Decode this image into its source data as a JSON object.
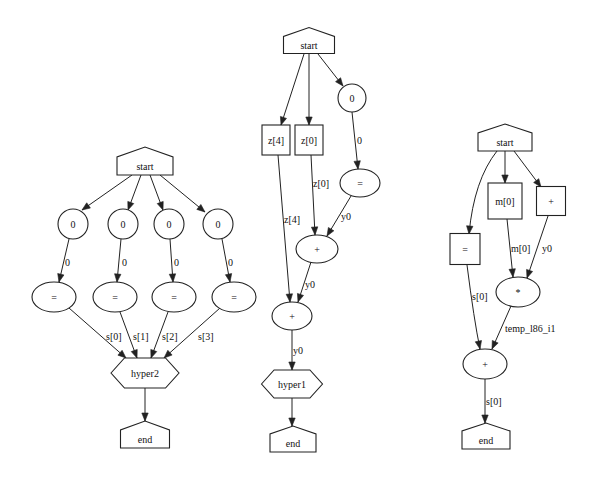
{
  "diagram": {
    "colors": {
      "stroke": "#222222",
      "background": "#ffffff",
      "text": "#111111"
    },
    "graphs": [
      {
        "id": "graph-hyper2",
        "nodes": [
          {
            "id": "g1_start",
            "label": "start",
            "shape": "house",
            "x": 145,
            "y": 166,
            "w": 56,
            "h": 18,
            "roof": 10
          },
          {
            "id": "g1_c0",
            "label": "0",
            "shape": "circle",
            "x": 73,
            "y": 224,
            "r": 15
          },
          {
            "id": "g1_c1",
            "label": "0",
            "shape": "circle",
            "x": 123,
            "y": 224,
            "r": 15
          },
          {
            "id": "g1_c2",
            "label": "0",
            "shape": "circle",
            "x": 169,
            "y": 224,
            "r": 15
          },
          {
            "id": "g1_c3",
            "label": "0",
            "shape": "circle",
            "x": 218,
            "y": 224,
            "r": 15
          },
          {
            "id": "g1_e0",
            "label": "=",
            "shape": "ellipse",
            "x": 54,
            "y": 297,
            "rx": 22,
            "ry": 15
          },
          {
            "id": "g1_e1",
            "label": "=",
            "shape": "ellipse",
            "x": 115,
            "y": 297,
            "rx": 22,
            "ry": 15
          },
          {
            "id": "g1_e2",
            "label": "=",
            "shape": "ellipse",
            "x": 174,
            "y": 297,
            "rx": 22,
            "ry": 15
          },
          {
            "id": "g1_e3",
            "label": "=",
            "shape": "ellipse",
            "x": 234,
            "y": 297,
            "rx": 22,
            "ry": 15
          },
          {
            "id": "g1_hyper",
            "label": "hyper2",
            "shape": "hexagon",
            "x": 145,
            "y": 373,
            "w": 68,
            "h": 30
          },
          {
            "id": "g1_end",
            "label": "end",
            "shape": "house",
            "x": 145,
            "y": 439,
            "w": 49,
            "h": 18,
            "roof": 9
          }
        ],
        "edges": [
          {
            "from": [
              132,
              175
            ],
            "to": [
              82,
              210
            ],
            "label": ""
          },
          {
            "from": [
              141,
              175
            ],
            "to": [
              128,
              210
            ],
            "label": ""
          },
          {
            "from": [
              150,
              175
            ],
            "to": [
              163,
              210
            ],
            "label": ""
          },
          {
            "from": [
              160,
              175
            ],
            "to": [
              205,
              212
            ],
            "label": ""
          },
          {
            "from": [
              69,
              239
            ],
            "to": [
              59,
              282
            ],
            "label": "0",
            "lx": 65,
            "ly": 262
          },
          {
            "from": [
              121,
              239
            ],
            "to": [
              117,
              282
            ],
            "label": "0",
            "lx": 122,
            "ly": 262
          },
          {
            "from": [
              170,
              239
            ],
            "to": [
              173,
              282
            ],
            "label": "0",
            "lx": 174,
            "ly": 262
          },
          {
            "from": [
              222,
              239
            ],
            "to": [
              230,
              282
            ],
            "label": "0",
            "lx": 228,
            "ly": 262
          },
          {
            "from": [
              69,
              308
            ],
            "to": [
              126,
              358
            ],
            "label": "s[0]",
            "lx": 106,
            "ly": 336
          },
          {
            "from": [
              120,
              312
            ],
            "to": [
              137,
              358
            ],
            "label": "s[1]",
            "lx": 133,
            "ly": 336
          },
          {
            "from": [
              168,
              312
            ],
            "to": [
              151,
              358
            ],
            "label": "s[2]",
            "lx": 162,
            "ly": 336
          },
          {
            "from": [
              220,
              308
            ],
            "to": [
              164,
              358
            ],
            "label": "s[3]",
            "lx": 198,
            "ly": 336
          },
          {
            "from": [
              145,
              388
            ],
            "to": [
              145,
              421
            ],
            "label": ""
          }
        ]
      },
      {
        "id": "graph-hyper1",
        "nodes": [
          {
            "id": "g2_start",
            "label": "start",
            "shape": "house",
            "x": 309,
            "y": 45,
            "w": 51,
            "h": 17,
            "roof": 9
          },
          {
            "id": "g2_z4",
            "label": "z[4]",
            "shape": "box",
            "x": 276,
            "y": 140,
            "w": 28,
            "h": 30
          },
          {
            "id": "g2_z0",
            "label": "z[0]",
            "shape": "box",
            "x": 309,
            "y": 140,
            "w": 28,
            "h": 30
          },
          {
            "id": "g2_c0",
            "label": "0",
            "shape": "circle",
            "x": 352,
            "y": 98,
            "r": 14
          },
          {
            "id": "g2_eq",
            "label": "=",
            "shape": "ellipse",
            "x": 360,
            "y": 183,
            "rx": 20,
            "ry": 14
          },
          {
            "id": "g2_plus1",
            "label": "+",
            "shape": "ellipse",
            "x": 317,
            "y": 249,
            "rx": 21,
            "ry": 14
          },
          {
            "id": "g2_plus2",
            "label": "+",
            "shape": "ellipse",
            "x": 292,
            "y": 316,
            "rx": 20,
            "ry": 14
          },
          {
            "id": "g2_hyper",
            "label": "hyper1",
            "shape": "hexagon",
            "x": 292,
            "y": 384,
            "w": 61,
            "h": 28
          },
          {
            "id": "g2_end",
            "label": "end",
            "shape": "house",
            "x": 293,
            "y": 443,
            "w": 46,
            "h": 18,
            "roof": 8
          }
        ],
        "edges": [
          {
            "from": [
              304,
              54
            ],
            "to": [
              281,
              125
            ],
            "label": ""
          },
          {
            "from": [
              309,
              54
            ],
            "to": [
              309,
              125
            ],
            "label": ""
          },
          {
            "from": [
              318,
              54
            ],
            "to": [
              343,
              86
            ],
            "label": ""
          },
          {
            "from": [
              352,
              112
            ],
            "to": [
              358,
              169
            ],
            "label": "0",
            "lx": 357,
            "ly": 140
          },
          {
            "from": [
              311,
              155
            ],
            "to": [
              315,
              235
            ],
            "label": "z[0]",
            "lx": 313,
            "ly": 183
          },
          {
            "from": [
              351,
              196
            ],
            "to": [
              327,
              236
            ],
            "label": "y0",
            "lx": 341,
            "ly": 216
          },
          {
            "from": [
              278,
              155
            ],
            "to": [
              290,
              302
            ],
            "label": "z[4]",
            "lx": 284,
            "ly": 219
          },
          {
            "from": [
              311,
              262
            ],
            "to": [
              298,
              302
            ],
            "label": "y0",
            "lx": 305,
            "ly": 284
          },
          {
            "from": [
              292,
              330
            ],
            "to": [
              292,
              370
            ],
            "label": "y0",
            "lx": 293,
            "ly": 350
          },
          {
            "from": [
              292,
              398
            ],
            "to": [
              292,
              426
            ],
            "label": ""
          }
        ]
      },
      {
        "id": "graph-temp",
        "nodes": [
          {
            "id": "g3_start",
            "label": "start",
            "shape": "house",
            "x": 505,
            "y": 142,
            "w": 54,
            "h": 18,
            "roof": 9
          },
          {
            "id": "g3_m0",
            "label": "m[0]",
            "shape": "box",
            "x": 505,
            "y": 201,
            "w": 34,
            "h": 36
          },
          {
            "id": "g3_plusbox",
            "label": "+",
            "shape": "box",
            "x": 551,
            "y": 201,
            "w": 29,
            "h": 29
          },
          {
            "id": "g3_eqbox",
            "label": "=",
            "shape": "box",
            "x": 465,
            "y": 249,
            "w": 30,
            "h": 31
          },
          {
            "id": "g3_mul",
            "label": "*",
            "shape": "ellipse",
            "x": 518,
            "y": 292,
            "rx": 22,
            "ry": 15
          },
          {
            "id": "g3_plus",
            "label": "+",
            "shape": "ellipse",
            "x": 485,
            "y": 364,
            "rx": 22,
            "ry": 15
          },
          {
            "id": "g3_end",
            "label": "end",
            "shape": "house",
            "x": 486,
            "y": 440,
            "w": 48,
            "h": 18,
            "roof": 8
          }
        ],
        "edges": [
          {
            "from": [
              497,
              151
            ],
            "to": [
              469,
              234
            ],
            "label": "",
            "curve": [
              474,
              180
            ]
          },
          {
            "from": [
              505,
              151
            ],
            "to": [
              505,
              183
            ],
            "label": ""
          },
          {
            "from": [
              514,
              151
            ],
            "to": [
              541,
              187
            ],
            "label": ""
          },
          {
            "from": [
              467,
              265
            ],
            "to": [
              480,
              349
            ],
            "label": "s[0]",
            "lx": 472,
            "ly": 296,
            "curve": [
              474,
              320
            ]
          },
          {
            "from": [
              507,
              219
            ],
            "to": [
              513,
              277
            ],
            "label": "m[0]",
            "lx": 511,
            "ly": 248
          },
          {
            "from": [
              548,
              216
            ],
            "to": [
              527,
              278
            ],
            "label": "y0",
            "lx": 542,
            "ly": 248
          },
          {
            "from": [
              511,
              306
            ],
            "to": [
              492,
              349
            ],
            "label": "temp_l86_i1",
            "lx": 505,
            "ly": 328
          },
          {
            "from": [
              485,
              379
            ],
            "to": [
              485,
              423
            ],
            "label": "s[0]",
            "lx": 486,
            "ly": 401
          }
        ]
      }
    ]
  }
}
